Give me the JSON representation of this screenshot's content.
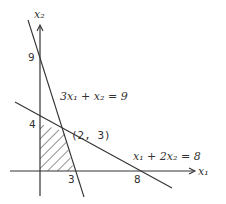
{
  "diagram": {
    "type": "linear-programming-feasible-region",
    "axes": {
      "x_label": "x₁",
      "y_label": "x₂"
    },
    "constraints": [
      {
        "equation": "3x₁ + x₂ = 9",
        "x_intercept": "3",
        "y_intercept": "9"
      },
      {
        "equation": "x₁ + 2x₂ = 8",
        "x_intercept": "8",
        "y_intercept": "4"
      }
    ],
    "intersection_point": "(2, 3)",
    "tick_labels": {
      "y9": "9",
      "y4": "4",
      "x3": "3",
      "x8": "8"
    },
    "feasible_region": {
      "vertices": [
        "(0,0)",
        "(3,0)",
        "(2,3)",
        "(0,4)"
      ],
      "fill": "hatched"
    },
    "colors": {
      "ink": "#333333",
      "background": "#ffffff"
    }
  }
}
